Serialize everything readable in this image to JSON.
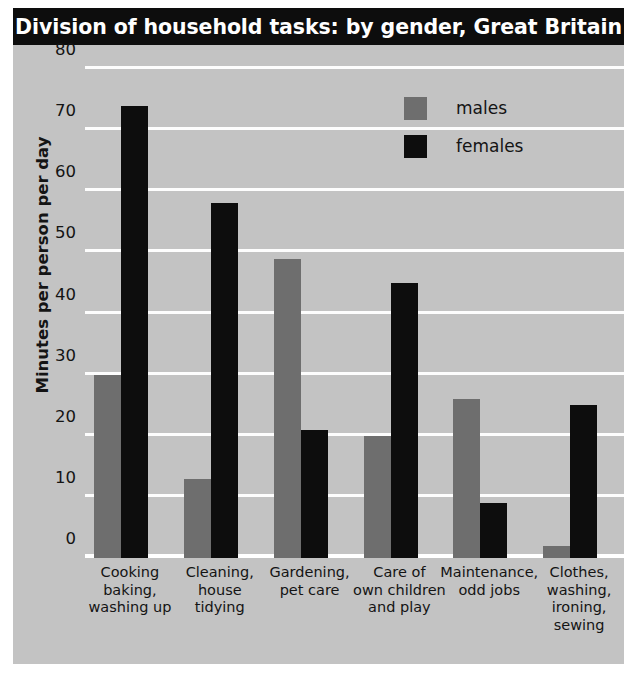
{
  "title": "Division of household tasks: by gender, Great Britain",
  "legend": {
    "items": [
      {
        "key": "males",
        "label": "males",
        "color": "#6e6e6e"
      },
      {
        "key": "females",
        "label": "females",
        "color": "#0d0d0d"
      }
    ]
  },
  "axes": {
    "ylabel": "Minutes per person per day",
    "yticks": [
      0,
      10,
      20,
      30,
      40,
      50,
      60,
      70,
      80
    ]
  },
  "colors": {
    "background": "#c3c3c3",
    "title_bar": "#0d0d0d",
    "title_text": "#ffffff",
    "gridline": "#fdfdfd",
    "males": "#6e6e6e",
    "females": "#0d0d0d"
  },
  "chart_data": {
    "type": "bar",
    "title": "Division of household tasks: by gender, Great Britain",
    "xlabel": "",
    "ylabel": "Minutes per person per day",
    "ylim": [
      0,
      80
    ],
    "ytick_step": 10,
    "grid": true,
    "legend_position": "top-right",
    "categories": [
      "Cooking baking, washing up",
      "Cleaning, house tidying",
      "Gardening, pet care",
      "Care of own children and play",
      "Maintenance, odd jobs",
      "Clothes, washing, ironing, sewing"
    ],
    "category_lines": [
      [
        "Cooking",
        "baking,",
        "washing up"
      ],
      [
        "Cleaning,",
        "house",
        "tidying"
      ],
      [
        "Gardening,",
        "pet care"
      ],
      [
        "Care of",
        "own children",
        "and play"
      ],
      [
        "Maintenance,",
        "odd jobs"
      ],
      [
        "Clothes,",
        "washing,",
        "ironing,",
        "sewing"
      ]
    ],
    "series": [
      {
        "name": "males",
        "values": [
          30,
          13,
          49,
          20,
          26,
          2
        ]
      },
      {
        "name": "females",
        "values": [
          74,
          58,
          21,
          45,
          9,
          25
        ]
      }
    ]
  }
}
